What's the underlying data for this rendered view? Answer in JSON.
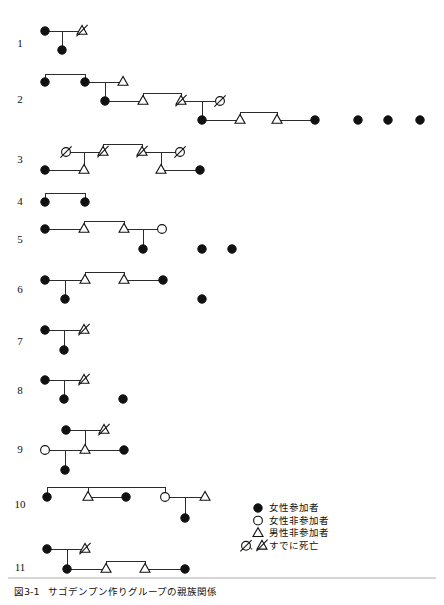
{
  "figure": {
    "caption_number": "図3-1",
    "caption_title": "サゴデンプン作りグループの親族関係",
    "width": 444,
    "height": 605,
    "symbol_colors": {
      "filled": "#111111",
      "outline": "#111111",
      "background": "#ffffff",
      "line": "#2b2b2b"
    }
  },
  "legend": {
    "items": [
      {
        "symbol": "filled-circle",
        "glyph": "●",
        "label": "女性参加者"
      },
      {
        "symbol": "open-circle",
        "glyph": "○",
        "label": "女性非参加者"
      },
      {
        "symbol": "open-triangle",
        "glyph": "△",
        "label": "男性非参加者"
      },
      {
        "symbol": "slashed-circle-and-triangle",
        "glyph": "∅、⊿",
        "label": "すでに死亡"
      }
    ],
    "x": 258,
    "y": 508
  },
  "rows": [
    {
      "number": "1",
      "label_x": 20,
      "label_y": 44,
      "nodes": [
        {
          "id": "r1-a",
          "type": "female-participant",
          "x": 45,
          "y": 31
        },
        {
          "id": "r1-b",
          "type": "male-nonparticipant-deceased",
          "x": 82,
          "y": 31
        },
        {
          "id": "r1-c",
          "type": "female-participant",
          "x": 62,
          "y": 50
        }
      ],
      "links": [
        {
          "kind": "union",
          "x1": 45,
          "y1": 31,
          "x2": 82,
          "y2": 31
        },
        {
          "kind": "descent",
          "x1": 62,
          "y1": 31,
          "x2": 62,
          "y2": 50
        }
      ]
    },
    {
      "number": "2",
      "label_x": 20,
      "label_y": 100,
      "nodes": [
        {
          "id": "r2-a",
          "type": "female-participant",
          "x": 45,
          "y": 82
        },
        {
          "id": "r2-b",
          "type": "female-participant",
          "x": 85,
          "y": 82
        },
        {
          "id": "r2-c",
          "type": "male-nonparticipant",
          "x": 123,
          "y": 82
        },
        {
          "id": "r2-d",
          "type": "female-participant",
          "x": 105,
          "y": 101
        },
        {
          "id": "r2-e",
          "type": "male-nonparticipant",
          "x": 143,
          "y": 101
        },
        {
          "id": "r2-f",
          "type": "male-nonparticipant-deceased",
          "x": 181,
          "y": 101
        },
        {
          "id": "r2-g",
          "type": "female-nonparticipant-deceased",
          "x": 220,
          "y": 101
        },
        {
          "id": "r2-h",
          "type": "female-participant",
          "x": 202,
          "y": 120
        },
        {
          "id": "r2-i",
          "type": "male-nonparticipant",
          "x": 240,
          "y": 120
        },
        {
          "id": "r2-j",
          "type": "male-nonparticipant",
          "x": 277,
          "y": 120
        },
        {
          "id": "r2-k",
          "type": "female-participant",
          "x": 315,
          "y": 120
        },
        {
          "id": "r2-l",
          "type": "female-participant",
          "x": 358,
          "y": 120
        },
        {
          "id": "r2-m",
          "type": "female-participant",
          "x": 388,
          "y": 120
        },
        {
          "id": "r2-n",
          "type": "female-participant",
          "x": 420,
          "y": 120
        }
      ],
      "links": [
        {
          "kind": "sibling-bar",
          "x1": 45,
          "y1": 74,
          "x2": 85,
          "y2": 74
        },
        {
          "kind": "sibling-drop-left",
          "x1": 45,
          "y1": 74,
          "x2": 45,
          "y2": 82
        },
        {
          "kind": "sibling-drop-right",
          "x1": 85,
          "y1": 74,
          "x2": 85,
          "y2": 82
        },
        {
          "kind": "union",
          "x1": 85,
          "y1": 82,
          "x2": 123,
          "y2": 82
        },
        {
          "kind": "descent",
          "x1": 105,
          "y1": 82,
          "x2": 105,
          "y2": 101
        },
        {
          "kind": "union",
          "x1": 105,
          "y1": 101,
          "x2": 143,
          "y2": 101
        },
        {
          "kind": "sibling-bar",
          "x1": 143,
          "y1": 93,
          "x2": 181,
          "y2": 93
        },
        {
          "kind": "sibling-drop-left",
          "x1": 143,
          "y1": 93,
          "x2": 143,
          "y2": 101
        },
        {
          "kind": "sibling-drop-right",
          "x1": 181,
          "y1": 93,
          "x2": 181,
          "y2": 101
        },
        {
          "kind": "union",
          "x1": 181,
          "y1": 101,
          "x2": 220,
          "y2": 101
        },
        {
          "kind": "descent",
          "x1": 202,
          "y1": 101,
          "x2": 202,
          "y2": 120
        },
        {
          "kind": "union",
          "x1": 202,
          "y1": 120,
          "x2": 240,
          "y2": 120
        },
        {
          "kind": "sibling-bar",
          "x1": 240,
          "y1": 112,
          "x2": 277,
          "y2": 112
        },
        {
          "kind": "sibling-drop-left",
          "x1": 240,
          "y1": 112,
          "x2": 240,
          "y2": 120
        },
        {
          "kind": "sibling-drop-right",
          "x1": 277,
          "y1": 112,
          "x2": 277,
          "y2": 120
        },
        {
          "kind": "union",
          "x1": 277,
          "y1": 120,
          "x2": 315,
          "y2": 120
        }
      ]
    },
    {
      "number": "3",
      "label_x": 20,
      "label_y": 160,
      "nodes": [
        {
          "id": "r3-a",
          "type": "female-nonparticipant-deceased",
          "x": 66,
          "y": 152
        },
        {
          "id": "r3-b",
          "type": "male-nonparticipant-deceased",
          "x": 103,
          "y": 152
        },
        {
          "id": "r3-c",
          "type": "male-nonparticipant-deceased",
          "x": 142,
          "y": 152
        },
        {
          "id": "r3-d",
          "type": "female-nonparticipant-deceased",
          "x": 180,
          "y": 152
        },
        {
          "id": "r3-e",
          "type": "female-participant",
          "x": 45,
          "y": 170
        },
        {
          "id": "r3-f",
          "type": "male-nonparticipant",
          "x": 84,
          "y": 170
        },
        {
          "id": "r3-g",
          "type": "male-nonparticipant",
          "x": 161,
          "y": 170
        },
        {
          "id": "r3-h",
          "type": "female-participant",
          "x": 200,
          "y": 170
        }
      ],
      "links": [
        {
          "kind": "union",
          "x1": 66,
          "y1": 152,
          "x2": 103,
          "y2": 152
        },
        {
          "kind": "descent",
          "x1": 84,
          "y1": 152,
          "x2": 84,
          "y2": 170
        },
        {
          "kind": "union",
          "x1": 142,
          "y1": 152,
          "x2": 180,
          "y2": 152
        },
        {
          "kind": "descent",
          "x1": 161,
          "y1": 152,
          "x2": 161,
          "y2": 170
        },
        {
          "kind": "sibling-bar",
          "x1": 103,
          "y1": 144,
          "x2": 142,
          "y2": 144
        },
        {
          "kind": "sibling-drop-left",
          "x1": 103,
          "y1": 144,
          "x2": 103,
          "y2": 152
        },
        {
          "kind": "sibling-drop-right",
          "x1": 142,
          "y1": 144,
          "x2": 142,
          "y2": 152
        },
        {
          "kind": "union",
          "x1": 45,
          "y1": 170,
          "x2": 84,
          "y2": 170
        },
        {
          "kind": "union",
          "x1": 161,
          "y1": 170,
          "x2": 200,
          "y2": 170
        }
      ]
    },
    {
      "number": "4",
      "label_x": 20,
      "label_y": 202,
      "nodes": [
        {
          "id": "r4-a",
          "type": "female-participant",
          "x": 45,
          "y": 202
        },
        {
          "id": "r4-b",
          "type": "female-participant",
          "x": 85,
          "y": 202
        }
      ],
      "links": [
        {
          "kind": "sibling-bar",
          "x1": 45,
          "y1": 193,
          "x2": 85,
          "y2": 193
        },
        {
          "kind": "sibling-drop-left",
          "x1": 45,
          "y1": 193,
          "x2": 45,
          "y2": 202
        },
        {
          "kind": "sibling-drop-right",
          "x1": 85,
          "y1": 193,
          "x2": 85,
          "y2": 202
        }
      ]
    },
    {
      "number": "5",
      "label_x": 20,
      "label_y": 240,
      "nodes": [
        {
          "id": "r5-a",
          "type": "female-participant",
          "x": 45,
          "y": 229
        },
        {
          "id": "r5-b",
          "type": "male-nonparticipant",
          "x": 84,
          "y": 229
        },
        {
          "id": "r5-c",
          "type": "male-nonparticipant",
          "x": 124,
          "y": 229
        },
        {
          "id": "r5-d",
          "type": "female-nonparticipant",
          "x": 162,
          "y": 229
        },
        {
          "id": "r5-e",
          "type": "female-participant",
          "x": 143,
          "y": 249
        },
        {
          "id": "r5-f",
          "type": "female-participant",
          "x": 202,
          "y": 249
        },
        {
          "id": "r5-g",
          "type": "female-participant",
          "x": 232,
          "y": 249
        }
      ],
      "links": [
        {
          "kind": "union",
          "x1": 45,
          "y1": 229,
          "x2": 84,
          "y2": 229
        },
        {
          "kind": "sibling-bar",
          "x1": 84,
          "y1": 221,
          "x2": 124,
          "y2": 221
        },
        {
          "kind": "sibling-drop-left",
          "x1": 84,
          "y1": 221,
          "x2": 84,
          "y2": 229
        },
        {
          "kind": "sibling-drop-right",
          "x1": 124,
          "y1": 221,
          "x2": 124,
          "y2": 229
        },
        {
          "kind": "union",
          "x1": 124,
          "y1": 229,
          "x2": 162,
          "y2": 229
        },
        {
          "kind": "descent",
          "x1": 143,
          "y1": 229,
          "x2": 143,
          "y2": 249
        }
      ]
    },
    {
      "number": "6",
      "label_x": 20,
      "label_y": 290,
      "nodes": [
        {
          "id": "r6-a",
          "type": "female-participant",
          "x": 45,
          "y": 280
        },
        {
          "id": "r6-b",
          "type": "male-nonparticipant",
          "x": 85,
          "y": 280
        },
        {
          "id": "r6-c",
          "type": "male-nonparticipant",
          "x": 124,
          "y": 280
        },
        {
          "id": "r6-d",
          "type": "female-participant",
          "x": 163,
          "y": 280
        },
        {
          "id": "r6-e",
          "type": "female-participant",
          "x": 65,
          "y": 299
        },
        {
          "id": "r6-f",
          "type": "female-participant",
          "x": 202,
          "y": 299
        }
      ],
      "links": [
        {
          "kind": "union",
          "x1": 45,
          "y1": 280,
          "x2": 85,
          "y2": 280
        },
        {
          "kind": "descent",
          "x1": 65,
          "y1": 280,
          "x2": 65,
          "y2": 299
        },
        {
          "kind": "sibling-bar",
          "x1": 85,
          "y1": 272,
          "x2": 124,
          "y2": 272
        },
        {
          "kind": "sibling-drop-left",
          "x1": 85,
          "y1": 272,
          "x2": 85,
          "y2": 280
        },
        {
          "kind": "sibling-drop-right",
          "x1": 124,
          "y1": 272,
          "x2": 124,
          "y2": 280
        },
        {
          "kind": "union",
          "x1": 124,
          "y1": 280,
          "x2": 163,
          "y2": 280
        }
      ]
    },
    {
      "number": "7",
      "label_x": 20,
      "label_y": 342,
      "nodes": [
        {
          "id": "r7-a",
          "type": "female-participant",
          "x": 45,
          "y": 330
        },
        {
          "id": "r7-b",
          "type": "male-nonparticipant-deceased",
          "x": 84,
          "y": 330
        },
        {
          "id": "r7-c",
          "type": "female-participant",
          "x": 64,
          "y": 350
        }
      ],
      "links": [
        {
          "kind": "union",
          "x1": 45,
          "y1": 330,
          "x2": 84,
          "y2": 330
        },
        {
          "kind": "descent",
          "x1": 64,
          "y1": 330,
          "x2": 64,
          "y2": 350
        }
      ]
    },
    {
      "number": "8",
      "label_x": 20,
      "label_y": 391,
      "nodes": [
        {
          "id": "r8-a",
          "type": "female-participant",
          "x": 45,
          "y": 380
        },
        {
          "id": "r8-b",
          "type": "male-nonparticipant-deceased",
          "x": 84,
          "y": 380
        },
        {
          "id": "r8-c",
          "type": "female-participant",
          "x": 64,
          "y": 399
        },
        {
          "id": "r8-d",
          "type": "female-participant",
          "x": 123,
          "y": 399
        }
      ],
      "links": [
        {
          "kind": "union",
          "x1": 45,
          "y1": 380,
          "x2": 84,
          "y2": 380
        },
        {
          "kind": "descent",
          "x1": 64,
          "y1": 380,
          "x2": 64,
          "y2": 399
        }
      ]
    },
    {
      "number": "9",
      "label_x": 20,
      "label_y": 450,
      "nodes": [
        {
          "id": "r9-a",
          "type": "female-participant",
          "x": 66,
          "y": 430
        },
        {
          "id": "r9-b",
          "type": "male-nonparticipant-deceased",
          "x": 104,
          "y": 430
        },
        {
          "id": "r9-c",
          "type": "female-nonparticipant",
          "x": 45,
          "y": 450
        },
        {
          "id": "r9-d",
          "type": "male-nonparticipant",
          "x": 85,
          "y": 450
        },
        {
          "id": "r9-e",
          "type": "female-participant",
          "x": 124,
          "y": 450
        },
        {
          "id": "r9-f",
          "type": "female-participant",
          "x": 65,
          "y": 470
        }
      ],
      "links": [
        {
          "kind": "union",
          "x1": 66,
          "y1": 430,
          "x2": 104,
          "y2": 430
        },
        {
          "kind": "descent",
          "x1": 85,
          "y1": 430,
          "x2": 85,
          "y2": 450
        },
        {
          "kind": "union",
          "x1": 45,
          "y1": 450,
          "x2": 85,
          "y2": 450
        },
        {
          "kind": "union",
          "x1": 85,
          "y1": 450,
          "x2": 124,
          "y2": 450
        },
        {
          "kind": "descent",
          "x1": 65,
          "y1": 450,
          "x2": 65,
          "y2": 470
        }
      ]
    },
    {
      "number": "10",
      "label_x": 20,
      "label_y": 505,
      "nodes": [
        {
          "id": "r10-a",
          "type": "female-participant",
          "x": 47,
          "y": 497
        },
        {
          "id": "r10-b",
          "type": "male-nonparticipant",
          "x": 88,
          "y": 497
        },
        {
          "id": "r10-c",
          "type": "female-participant",
          "x": 126,
          "y": 497
        },
        {
          "id": "r10-d",
          "type": "female-nonparticipant",
          "x": 165,
          "y": 497
        },
        {
          "id": "r10-e",
          "type": "male-nonparticipant",
          "x": 205,
          "y": 497
        },
        {
          "id": "r10-f",
          "type": "female-participant",
          "x": 185,
          "y": 518
        }
      ],
      "links": [
        {
          "kind": "sibling-bar",
          "x1": 47,
          "y1": 487,
          "x2": 165,
          "y2": 487
        },
        {
          "kind": "sibling-drop-left",
          "x1": 47,
          "y1": 487,
          "x2": 47,
          "y2": 497
        },
        {
          "kind": "sibling-drop-mid",
          "x1": 88,
          "y1": 487,
          "x2": 88,
          "y2": 497
        },
        {
          "kind": "sibling-drop-right",
          "x1": 165,
          "y1": 487,
          "x2": 165,
          "y2": 497
        },
        {
          "kind": "union",
          "x1": 88,
          "y1": 497,
          "x2": 126,
          "y2": 497
        },
        {
          "kind": "union",
          "x1": 165,
          "y1": 497,
          "x2": 205,
          "y2": 497
        },
        {
          "kind": "descent",
          "x1": 185,
          "y1": 497,
          "x2": 185,
          "y2": 518
        }
      ]
    },
    {
      "number": "11",
      "label_x": 20,
      "label_y": 568,
      "nodes": [
        {
          "id": "r11-a",
          "type": "female-participant",
          "x": 47,
          "y": 549
        },
        {
          "id": "r11-b",
          "type": "male-nonparticipant-deceased",
          "x": 85,
          "y": 549
        },
        {
          "id": "r11-c",
          "type": "female-participant",
          "x": 67,
          "y": 569
        },
        {
          "id": "r11-d",
          "type": "male-nonparticipant",
          "x": 106,
          "y": 569
        },
        {
          "id": "r11-e",
          "type": "male-nonparticipant",
          "x": 145,
          "y": 569
        },
        {
          "id": "r11-f",
          "type": "female-participant",
          "x": 185,
          "y": 569
        }
      ],
      "links": [
        {
          "kind": "union",
          "x1": 47,
          "y1": 549,
          "x2": 85,
          "y2": 549
        },
        {
          "kind": "descent",
          "x1": 67,
          "y1": 549,
          "x2": 67,
          "y2": 569
        },
        {
          "kind": "union",
          "x1": 67,
          "y1": 569,
          "x2": 106,
          "y2": 569
        },
        {
          "kind": "sibling-bar",
          "x1": 106,
          "y1": 561,
          "x2": 145,
          "y2": 561
        },
        {
          "kind": "sibling-drop-left",
          "x1": 106,
          "y1": 561,
          "x2": 106,
          "y2": 569
        },
        {
          "kind": "sibling-drop-right",
          "x1": 145,
          "y1": 561,
          "x2": 145,
          "y2": 569
        },
        {
          "kind": "union",
          "x1": 145,
          "y1": 569,
          "x2": 185,
          "y2": 569
        }
      ]
    }
  ]
}
